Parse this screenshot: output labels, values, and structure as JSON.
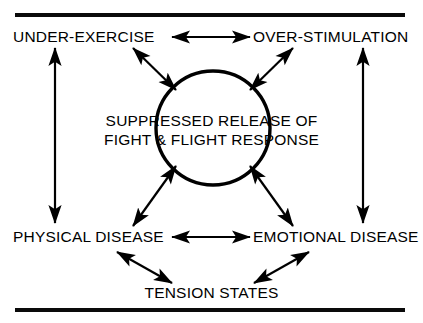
{
  "figure": {
    "nodes": {
      "top_left": "UNDER-EXERCISE",
      "top_right": "OVER-STIMULATION",
      "center_line1": "SUPPRESSED RELEASE OF",
      "center_line2": "FIGHT & FLIGHT RESPONSE",
      "bottom_left": "PHYSICAL DISEASE",
      "bottom_right": "EMOTIONAL DISEASE",
      "bottom_center": "TENSION STATES"
    },
    "colors": {
      "ink": "#000000",
      "background": "#ffffff",
      "rule": "#0a0a0a"
    },
    "rules": {
      "top_rule_label": "top-horizontal-rule",
      "bottom_rule_label": "bottom-horizontal-rule"
    },
    "connectors": [
      {
        "name": "under-exercise-to-over-stimulation",
        "from": "UNDER-EXERCISE",
        "to": "OVER-STIMULATION",
        "style": "double-headed-horizontal"
      },
      {
        "name": "under-exercise-to-center",
        "from": "UNDER-EXERCISE",
        "to": "SUPPRESSED RELEASE OF FIGHT & FLIGHT RESPONSE",
        "style": "double-headed-diagonal"
      },
      {
        "name": "over-stimulation-to-center",
        "from": "OVER-STIMULATION",
        "to": "SUPPRESSED RELEASE OF FIGHT & FLIGHT RESPONSE",
        "style": "double-headed-diagonal"
      },
      {
        "name": "center-to-physical-disease",
        "from": "SUPPRESSED RELEASE OF FIGHT & FLIGHT RESPONSE",
        "to": "PHYSICAL DISEASE",
        "style": "double-headed-diagonal"
      },
      {
        "name": "center-to-emotional-disease",
        "from": "SUPPRESSED RELEASE OF FIGHT & FLIGHT RESPONSE",
        "to": "EMOTIONAL DISEASE",
        "style": "double-headed-diagonal"
      },
      {
        "name": "physical-disease-to-emotional-disease",
        "from": "PHYSICAL DISEASE",
        "to": "EMOTIONAL DISEASE",
        "style": "double-headed-horizontal"
      },
      {
        "name": "physical-disease-to-tension-states",
        "from": "PHYSICAL DISEASE",
        "to": "TENSION STATES",
        "style": "double-headed-diagonal"
      },
      {
        "name": "emotional-disease-to-tension-states",
        "from": "EMOTIONAL DISEASE",
        "to": "TENSION STATES",
        "style": "double-headed-diagonal"
      },
      {
        "name": "under-exercise-to-physical-disease",
        "from": "UNDER-EXERCISE",
        "to": "PHYSICAL DISEASE",
        "style": "double-headed-vertical"
      },
      {
        "name": "over-stimulation-to-emotional-disease",
        "from": "OVER-STIMULATION",
        "to": "EMOTIONAL DISEASE",
        "style": "double-headed-vertical"
      }
    ]
  }
}
